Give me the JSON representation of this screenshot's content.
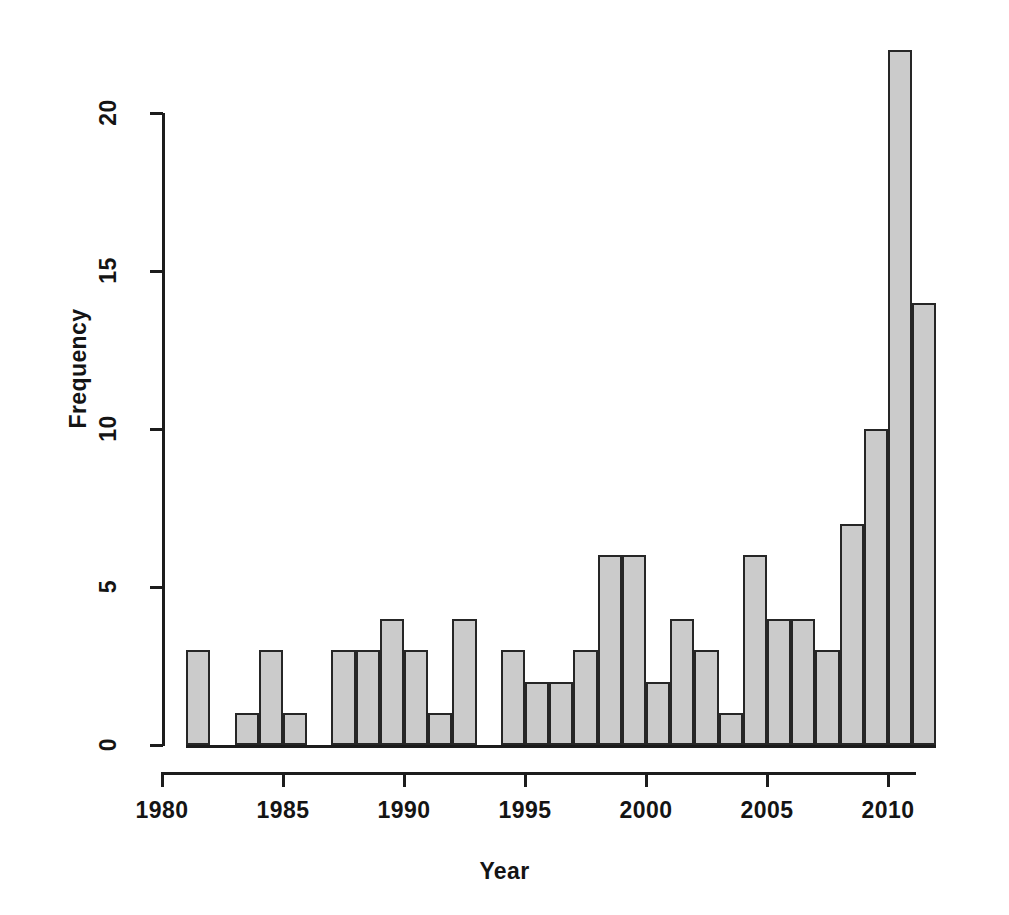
{
  "chart_data": {
    "type": "bar",
    "title": "",
    "subtitle": "",
    "xlabel": "Year",
    "ylabel": "Frequency",
    "xlim": [
      1980,
      2012
    ],
    "ylim": [
      0,
      22
    ],
    "grid": false,
    "legend": null,
    "bar_fill_color": "#cbcbcb",
    "bar_border_color": "#262626",
    "axis_color": "#1c1c1c",
    "bin_width": 1,
    "x_ticks": [
      1980,
      1985,
      1990,
      1995,
      2000,
      2005,
      2010
    ],
    "x_tick_labels": [
      "1980",
      "1985",
      "1990",
      "1995",
      "2000",
      "2005",
      "2010"
    ],
    "y_ticks": [
      0,
      5,
      10,
      15,
      20
    ],
    "y_tick_labels": [
      "0",
      "5",
      "10",
      "15",
      "20"
    ],
    "categories": [
      "1981",
      "1982",
      "1983",
      "1984",
      "1985",
      "1986",
      "1987",
      "1988",
      "1989",
      "1990",
      "1991",
      "1992",
      "1993",
      "1994",
      "1995",
      "1996",
      "1997",
      "1998",
      "1999",
      "2000",
      "2001",
      "2002",
      "2003",
      "2004",
      "2005",
      "2006",
      "2007",
      "2008",
      "2009",
      "2010",
      "2011"
    ],
    "values": [
      3,
      0,
      1,
      3,
      1,
      0,
      3,
      3,
      4,
      3,
      1,
      4,
      0,
      3,
      2,
      2,
      3,
      6,
      6,
      2,
      4,
      3,
      1,
      6,
      4,
      4,
      3,
      7,
      10,
      22,
      14
    ],
    "total_count": 118,
    "max_value": 22,
    "max_category": "2010"
  }
}
